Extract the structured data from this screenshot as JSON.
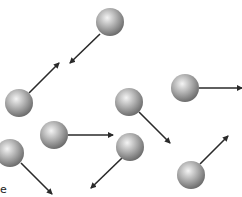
{
  "diagram": {
    "type": "gas-particles-with-velocity-vectors",
    "background": "#ffffff",
    "particle_color": "#9a9a9a",
    "arrow_color": "#2a2a2a",
    "particles": [
      {
        "cx": 110,
        "cy": 22,
        "r": 14,
        "arrow": {
          "x1": 100,
          "y1": 34,
          "x2": 70,
          "y2": 63
        }
      },
      {
        "cx": 19,
        "cy": 103,
        "r": 14,
        "arrow": {
          "x1": 29,
          "y1": 93,
          "x2": 59,
          "y2": 63
        }
      },
      {
        "cx": 185,
        "cy": 88,
        "r": 14,
        "arrow": {
          "x1": 199,
          "y1": 88,
          "x2": 242,
          "y2": 88
        }
      },
      {
        "cx": 129,
        "cy": 102,
        "r": 14,
        "arrow": {
          "x1": 139,
          "y1": 112,
          "x2": 170,
          "y2": 143
        }
      },
      {
        "cx": 54,
        "cy": 135,
        "r": 14,
        "arrow": {
          "x1": 68,
          "y1": 135,
          "x2": 113,
          "y2": 135
        }
      },
      {
        "cx": 130,
        "cy": 147,
        "r": 14,
        "arrow": {
          "x1": 122,
          "y1": 158,
          "x2": 91,
          "y2": 188
        }
      },
      {
        "cx": 10,
        "cy": 153,
        "r": 14,
        "arrow": {
          "x1": 21,
          "y1": 163,
          "x2": 52,
          "y2": 194
        }
      },
      {
        "cx": 191,
        "cy": 175,
        "r": 14,
        "arrow": {
          "x1": 200,
          "y1": 164,
          "x2": 228,
          "y2": 136
        }
      }
    ],
    "label_fragment": "e"
  }
}
